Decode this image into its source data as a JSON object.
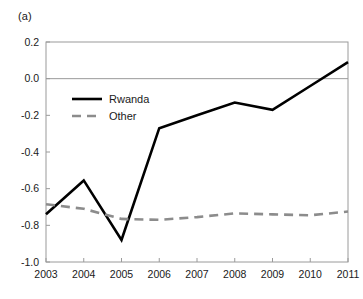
{
  "figure": {
    "panel_label": "(a)"
  },
  "chart_data": {
    "type": "line",
    "title": "",
    "subtitle": "",
    "xlabel": "",
    "ylabel": "",
    "categories": [
      "2003",
      "2004",
      "2005",
      "2006",
      "2007",
      "2008",
      "2009",
      "2010",
      "2011"
    ],
    "x": [
      2003,
      2004,
      2005,
      2006,
      2007,
      2008,
      2009,
      2010,
      2011
    ],
    "xlim": [
      2003,
      2011
    ],
    "ylim": [
      -1.0,
      0.2
    ],
    "ytick_labels": [
      "0.2",
      "0.0",
      "-0.2",
      "-0.4",
      "-0.6",
      "-0.8",
      "-1.0"
    ],
    "ytick_values": [
      0.2,
      0.0,
      -0.2,
      -0.4,
      -0.6,
      -0.8,
      -1.0
    ],
    "xtick_labels": [
      "2003",
      "2004",
      "2005",
      "2006",
      "2007",
      "2008",
      "2009",
      "2010",
      "2011"
    ],
    "grid": false,
    "zero_line": 0.0,
    "legend_position": "upper left",
    "series": [
      {
        "name": "Rwanda",
        "style": "solid",
        "color": "#000000",
        "width": 2.6,
        "values": [
          -0.74,
          -0.555,
          -0.88,
          -0.27,
          -0.2,
          -0.13,
          -0.17,
          -0.04,
          0.09
        ]
      },
      {
        "name": "Other",
        "style": "dashed",
        "color": "#8c8c8c",
        "width": 2.6,
        "values": [
          -0.685,
          -0.71,
          -0.765,
          -0.77,
          -0.755,
          -0.735,
          -0.74,
          -0.745,
          -0.725
        ]
      }
    ]
  },
  "colors": {
    "rwanda": "#000000",
    "other": "#8c8c8c",
    "axis": "#9a9a9a",
    "zero_line": "#9a9a9a",
    "text": "#1a1a1a",
    "background": "#ffffff"
  }
}
